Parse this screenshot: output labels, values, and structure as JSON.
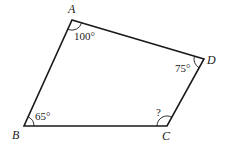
{
  "figure": {
    "type": "quadrilateral",
    "stroke_color": "#1a1a1a",
    "background": "#ffffff",
    "vertices": [
      {
        "name": "A",
        "x": 72,
        "y": 20,
        "label_x": 68,
        "label_y": 13
      },
      {
        "name": "B",
        "x": 24,
        "y": 126,
        "label_x": 12,
        "label_y": 139
      },
      {
        "name": "C",
        "x": 167,
        "y": 126,
        "label_x": 162,
        "label_y": 140
      },
      {
        "name": "D",
        "x": 204,
        "y": 59,
        "label_x": 207,
        "label_y": 64
      }
    ],
    "angles": [
      {
        "vertex": "A",
        "label": "100°"
      },
      {
        "vertex": "B",
        "label": "65°"
      },
      {
        "vertex": "C",
        "label": "?"
      },
      {
        "vertex": "D",
        "label": "75°"
      }
    ]
  }
}
